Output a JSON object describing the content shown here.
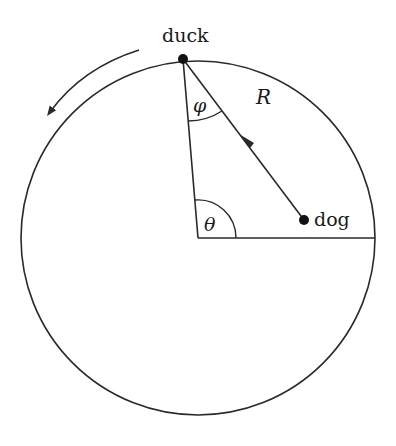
{
  "diagram": {
    "labels": {
      "duck": "duck",
      "dog": "dog",
      "radius": "R",
      "phi": "φ",
      "theta": "θ"
    },
    "colors": {
      "stroke": "#2a2a2a",
      "background": "#ffffff"
    },
    "geometry": {
      "circle_center": [
        198,
        238
      ],
      "circle_radius": 177,
      "duck_point": [
        183,
        59
      ],
      "dog_point": [
        304,
        220
      ],
      "direction_arrow": "counterclockwise"
    }
  }
}
